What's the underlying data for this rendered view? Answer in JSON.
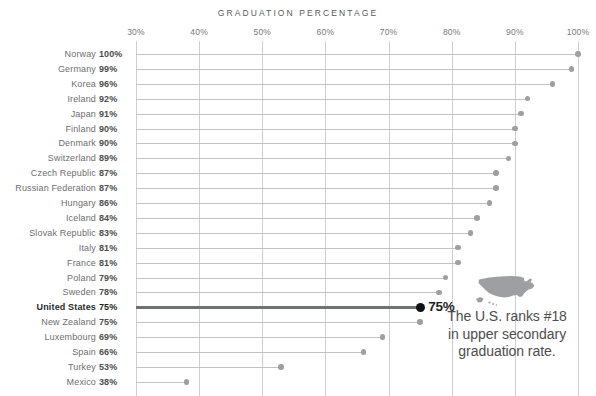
{
  "chart_data": {
    "type": "bar",
    "title": "GRADUATION PERCENTAGE",
    "xlabel": "",
    "ylabel": "",
    "xlim": [
      30,
      100
    ],
    "grid": true,
    "legend": "none",
    "orientation": "horizontal",
    "tick_labels": [
      "30%",
      "40%",
      "50%",
      "60%",
      "70%",
      "80%",
      "90%",
      "100%"
    ],
    "ticks": [
      30,
      40,
      50,
      60,
      70,
      80,
      90,
      100
    ],
    "categories": [
      "Norway",
      "Germany",
      "Korea",
      "Ireland",
      "Japan",
      "Finland",
      "Denmark",
      "Switzerland",
      "Czech Republic",
      "Russian Federation",
      "Hungary",
      "Iceland",
      "Slovak Republic",
      "Italy",
      "France",
      "Poland",
      "Sweden",
      "United States",
      "New Zealand",
      "Luxembourg",
      "Spain",
      "Turkey",
      "Mexico"
    ],
    "values": [
      100,
      99,
      96,
      92,
      91,
      90,
      90,
      89,
      87,
      87,
      86,
      84,
      83,
      81,
      81,
      79,
      78,
      75,
      75,
      69,
      66,
      53,
      38
    ],
    "value_labels": [
      "100%",
      "99%",
      "96%",
      "92%",
      "91%",
      "90%",
      "90%",
      "89%",
      "87%",
      "87%",
      "86%",
      "84%",
      "83%",
      "81%",
      "81%",
      "79%",
      "78%",
      "75%",
      "75%",
      "69%",
      "66%",
      "53%",
      "38%"
    ],
    "highlight_category": "United States",
    "highlight_value": 75,
    "highlight_label": "75%",
    "annotations": [
      "The U.S. ranks #18",
      "in upper secondary",
      "graduation rate."
    ],
    "colors": {
      "line": "#c2c2c2",
      "dot": "#9d9fa2",
      "highlight_line": "#6f7173",
      "highlight_dot": "#111111",
      "grid": "#cfcfcf",
      "text": "#6d6e70",
      "value_text": "#4e4e4e",
      "title": "#5a5a5a",
      "annotation_text": "#4d4d4d",
      "map": "#9d9fa2"
    }
  },
  "icons": {
    "us_map": "united-states-map-silhouette"
  }
}
